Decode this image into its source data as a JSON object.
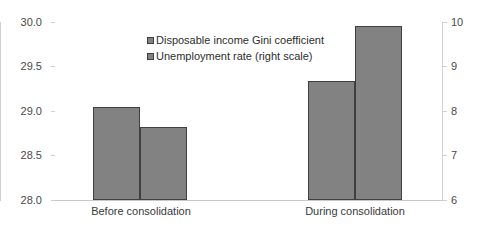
{
  "chart_data": {
    "type": "bar",
    "title": "",
    "subtitle": "",
    "xlabel": "",
    "ylabel": "",
    "categories": [
      "Before consolidation",
      "During consolidation"
    ],
    "series": [
      {
        "name": "Disposable income Gini coefficient",
        "axis": "left",
        "values": [
          29.04,
          29.34
        ],
        "color": "#828282"
      },
      {
        "name": "Unemployment rate (right scale)",
        "axis": "right",
        "values": [
          7.65,
          9.9
        ],
        "color": "#828282"
      }
    ],
    "left_axis": {
      "ylim": [
        28.0,
        30.0
      ],
      "ticks": [
        "28.0",
        "28.5",
        "29.0",
        "29.5",
        "30.0"
      ],
      "tick_values": [
        28.0,
        28.5,
        29.0,
        29.5,
        30.0
      ]
    },
    "right_axis": {
      "ylim": [
        6,
        10
      ],
      "ticks": [
        "6",
        "7",
        "8",
        "9",
        "10"
      ],
      "tick_values": [
        6,
        7,
        8,
        9,
        10
      ]
    },
    "legend": {
      "position": "inside-top-center",
      "entries": [
        "Disposable income Gini coefficient",
        "Unemployment rate (right scale)"
      ]
    },
    "grid": false,
    "colors": {
      "bar_fill": "#828282",
      "bar_border": "#404040",
      "axis_line": "#d0d0d0",
      "text": "#3a3a3a",
      "background": "#ffffff"
    }
  }
}
